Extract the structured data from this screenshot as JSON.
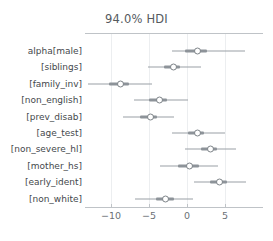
{
  "chart_data": {
    "type": "scatter",
    "title": "94.0% HDI",
    "xlabel": "",
    "ylabel": "",
    "xlim": [
      -13.5,
      10.0
    ],
    "xticks": [
      -10,
      -5,
      0,
      5
    ],
    "xticklabels": [
      "−10",
      "−5",
      "0",
      "5"
    ],
    "grid": true,
    "legend": false,
    "plot_style": "forest",
    "reference_value": 0,
    "categories": [
      "alpha[male]",
      "[siblings]",
      "[family_inv]",
      "[non_english]",
      "[prev_disab]",
      "[age_test]",
      "[non_severe_hl]",
      "[mother_hs]",
      "[early_ident]",
      "[non_white]"
    ],
    "series": [
      {
        "name": "posterior",
        "point_estimate_label": "mean",
        "points": [
          {
            "category": "alpha[male]",
            "value": 1.2,
            "hdi_94": [
              -2.0,
              7.6
            ],
            "hdi_50": [
              -0.2,
              2.6
            ]
          },
          {
            "category": "[siblings]",
            "value": -1.9,
            "hdi_94": [
              -5.1,
              1.8
            ],
            "hdi_50": [
              -3.0,
              -0.9
            ]
          },
          {
            "category": "[family_inv]",
            "value": -8.9,
            "hdi_94": [
              -13.0,
              -4.6
            ],
            "hdi_50": [
              -10.3,
              -7.6
            ]
          },
          {
            "category": "[non_english]",
            "value": -3.8,
            "hdi_94": [
              -7.0,
              0.1
            ],
            "hdi_50": [
              -5.0,
              -2.6
            ]
          },
          {
            "category": "[prev_disab]",
            "value": -5.0,
            "hdi_94": [
              -8.4,
              -1.7
            ],
            "hdi_50": [
              -6.2,
              -3.9
            ]
          },
          {
            "category": "[age_test]",
            "value": 1.2,
            "hdi_94": [
              -2.0,
              5.0
            ],
            "hdi_50": [
              0.1,
              2.3
            ]
          },
          {
            "category": "[non_severe_hl]",
            "value": 2.9,
            "hdi_94": [
              -0.3,
              6.4
            ],
            "hdi_50": [
              1.8,
              4.0
            ]
          },
          {
            "category": "[mother_hs]",
            "value": 0.2,
            "hdi_94": [
              -3.6,
              4.1
            ],
            "hdi_50": [
              -1.2,
              1.6
            ]
          },
          {
            "category": "[early_ident]",
            "value": 4.2,
            "hdi_94": [
              0.9,
              7.7
            ],
            "hdi_50": [
              3.0,
              5.3
            ]
          },
          {
            "category": "[non_white]",
            "value": -2.9,
            "hdi_94": [
              -6.8,
              0.8
            ],
            "hdi_50": [
              -4.1,
              -1.7
            ]
          }
        ]
      }
    ]
  },
  "colors": {
    "line": "#9aa0a6",
    "inner": "#8d9399",
    "marker_edge": "#7d8388",
    "marker_face": "#ffffff",
    "grid": "#eceef0",
    "axis": "#bfc3c7",
    "text": "#44484c",
    "title_text": "#555a5e"
  }
}
